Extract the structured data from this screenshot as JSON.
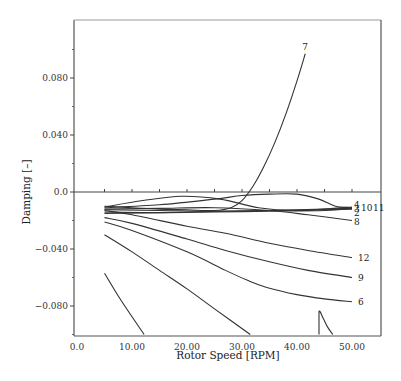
{
  "chart_data": {
    "type": "line",
    "title": "",
    "xlabel": "Rotor Speed [RPM]",
    "ylabel": "Damping [–]",
    "xlim": [
      0,
      55.3
    ],
    "ylim": [
      -0.1,
      0.12
    ],
    "grid": false,
    "legend": "none (inline curve labels at right end)",
    "x_ticks": [
      0,
      10,
      20,
      30,
      40,
      50
    ],
    "x_tick_labels": [
      "0.0",
      "10.00",
      "20.00",
      "30.00",
      "40.00",
      "50.00"
    ],
    "y_ticks": [
      -0.08,
      -0.04,
      0.0,
      0.04,
      0.08
    ],
    "y_tick_labels": [
      "−0.080",
      "−0.040",
      "0.0",
      "0.040",
      "0.080"
    ],
    "y_minor_ticks": [
      -0.1,
      -0.06,
      -0.02,
      0.02,
      0.06,
      0.1
    ],
    "x_minor_ticks": [
      5,
      15,
      25,
      35,
      45
    ],
    "series": [
      {
        "name": "7",
        "label": "7",
        "x": [
          5,
          10,
          15,
          20,
          25,
          28,
          30,
          32,
          34,
          36,
          38,
          40,
          41.5
        ],
        "y": [
          -0.01,
          -0.011,
          -0.012,
          -0.0125,
          -0.013,
          -0.011,
          -0.006,
          0.004,
          0.018,
          0.035,
          0.055,
          0.078,
          0.097
        ]
      },
      {
        "name": "12",
        "label": "12",
        "x": [
          5,
          10,
          20,
          27,
          35,
          42,
          50
        ],
        "y": [
          -0.013,
          -0.016,
          -0.024,
          -0.029,
          -0.036,
          -0.041,
          -0.046
        ]
      },
      {
        "name": "9",
        "label": "9",
        "x": [
          5,
          10,
          20,
          27,
          35,
          42,
          50
        ],
        "y": [
          -0.018,
          -0.022,
          -0.033,
          -0.041,
          -0.049,
          -0.055,
          -0.06
        ]
      },
      {
        "name": "6",
        "label": "6",
        "x": [
          5,
          10,
          20,
          27,
          31,
          34.5,
          40,
          45,
          50
        ],
        "y": [
          -0.021,
          -0.027,
          -0.042,
          -0.055,
          -0.062,
          -0.067,
          -0.072,
          -0.075,
          -0.077
        ]
      },
      {
        "name": "8",
        "label": "8",
        "x": [
          5,
          15,
          25,
          35,
          42,
          50
        ],
        "y": [
          -0.012,
          -0.0115,
          -0.011,
          -0.013,
          -0.016,
          -0.02
        ]
      },
      {
        "name": "4",
        "label": "4",
        "x": [
          5,
          12,
          19,
          26,
          33,
          40,
          45,
          50
        ],
        "y": [
          -0.0105,
          -0.006,
          -0.003,
          -0.005,
          -0.011,
          -0.013,
          -0.012,
          -0.0105
        ]
      },
      {
        "name": "3",
        "label": "3",
        "x": [
          5,
          15,
          25,
          30,
          35,
          40,
          44,
          47,
          50
        ],
        "y": [
          -0.011,
          -0.009,
          -0.005,
          -0.0025,
          -0.0015,
          -0.0015,
          -0.005,
          -0.01,
          -0.011
        ]
      },
      {
        "name": "2",
        "label": "2",
        "x": [
          5,
          15,
          25,
          35,
          45,
          50
        ],
        "y": [
          -0.0125,
          -0.013,
          -0.0135,
          -0.013,
          -0.012,
          -0.0115
        ]
      },
      {
        "name": "10",
        "label": "10",
        "x": [
          5,
          15,
          25,
          35,
          45,
          50
        ],
        "y": [
          -0.014,
          -0.0145,
          -0.014,
          -0.0135,
          -0.013,
          -0.0115
        ]
      },
      {
        "name": "11",
        "label": "11",
        "x": [
          5,
          15,
          25,
          35,
          45,
          50
        ],
        "y": [
          -0.015,
          -0.0145,
          -0.0135,
          -0.013,
          -0.0125,
          -0.012
        ]
      },
      {
        "name": "1",
        "label": "",
        "x": [
          5,
          8,
          12.2
        ],
        "y": [
          -0.057,
          -0.076,
          -0.1
        ]
      },
      {
        "name": "5",
        "label": "",
        "x": [
          5,
          10,
          15,
          20,
          25,
          31.5
        ],
        "y": [
          -0.03,
          -0.042,
          -0.055,
          -0.068,
          -0.082,
          -0.1
        ]
      },
      {
        "name": "13",
        "label": "",
        "x": [
          44,
          44,
          44.8,
          45.6,
          46.5
        ],
        "y": [
          -0.1,
          -0.084,
          -0.089,
          -0.095,
          -0.1
        ]
      }
    ]
  }
}
